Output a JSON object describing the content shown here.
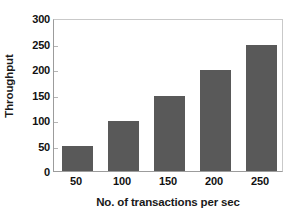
{
  "chart_data": {
    "type": "bar",
    "title": "",
    "xlabel": "No. of transactions per sec",
    "ylabel": "Throughput",
    "categories": [
      "50",
      "100",
      "150",
      "200",
      "250"
    ],
    "values": [
      49,
      99,
      148,
      199,
      248
    ],
    "ylim": [
      0,
      300
    ],
    "yticks": [
      0,
      50,
      100,
      150,
      200,
      250,
      300
    ],
    "ytick_labels": [
      "0",
      "50",
      "100",
      "150",
      "200",
      "250",
      "300"
    ],
    "grid": false,
    "legend": null,
    "bar_color": "#595959",
    "axis_color": "#9c9c9c",
    "frame_color": "#c9c9c9",
    "text_color": "#111111"
  }
}
